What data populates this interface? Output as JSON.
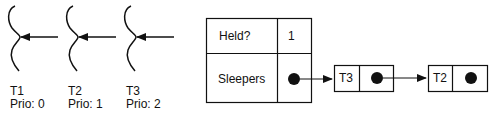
{
  "threads": [
    {
      "name": "T1",
      "priority_label": "Prio: 0"
    },
    {
      "name": "T2",
      "priority_label": "Prio: 1"
    },
    {
      "name": "T3",
      "priority_label": "Prio: 2"
    }
  ],
  "lock": {
    "rows": [
      {
        "label": "Held?",
        "value": "1"
      },
      {
        "label": "Sleepers",
        "value": "pointer"
      }
    ]
  },
  "sleeper_queue": [
    {
      "thread": "T3"
    },
    {
      "thread": "T2"
    }
  ],
  "colors": {
    "stroke": "#111111",
    "background": "#ffffff"
  }
}
